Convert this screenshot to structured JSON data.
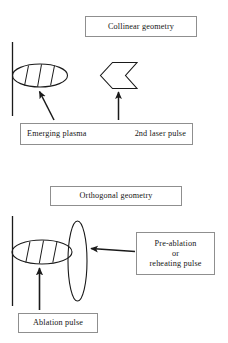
{
  "figure": {
    "type": "diagram",
    "panels": [
      {
        "id": "collinear",
        "title": "Collinear geometry",
        "elements": [
          {
            "name": "target-surface-line",
            "icon": "vertical-line"
          },
          {
            "name": "plasma-plume",
            "icon": "hatched-horizontal-ellipse",
            "hatch_lines": 3
          },
          {
            "name": "laser-pulse-chevron",
            "icon": "left-pointing-chevron"
          },
          {
            "name": "plasma-callout-arrow",
            "icon": "diagonal-arrow-up-left"
          },
          {
            "name": "laser-callout-arrow",
            "icon": "vertical-arrow-up"
          }
        ],
        "labels": {
          "plasma": "Emerging plasma",
          "laser": "2nd laser pulse"
        }
      },
      {
        "id": "orthogonal",
        "title": "Orthogonal geometry",
        "elements": [
          {
            "name": "target-surface-line",
            "icon": "vertical-line"
          },
          {
            "name": "plasma-plume",
            "icon": "hatched-horizontal-ellipse",
            "hatch_lines": 3
          },
          {
            "name": "orthogonal-beam",
            "icon": "vertical-ellipse"
          },
          {
            "name": "pulse-callout-arrow",
            "icon": "horizontal-arrow-left"
          },
          {
            "name": "ablation-callout-arrow",
            "icon": "vertical-arrow-up"
          }
        ],
        "labels": {
          "pulse_line_1": "Pre-ablation",
          "pulse_line_2": "or",
          "pulse_line_3": "reheating pulse",
          "ablation": "Ablation pulse"
        }
      }
    ]
  },
  "colors": {
    "stroke": "#1a1a1a",
    "box_border": "#8f8f8f",
    "text": "#161616",
    "background": "#ffffff"
  }
}
